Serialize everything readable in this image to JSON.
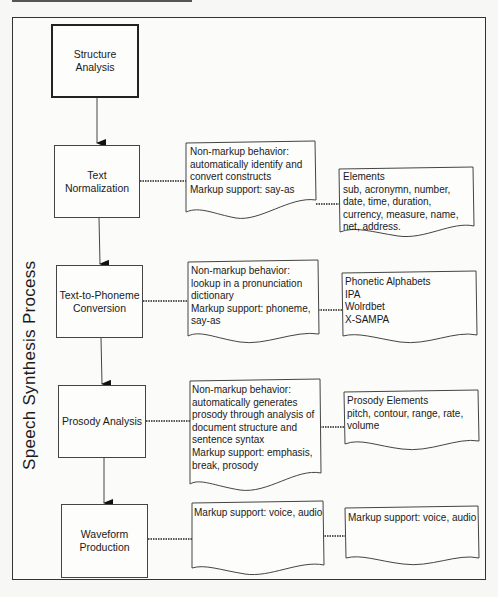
{
  "diagram": {
    "title": "Speech Synthesis Process",
    "steps": [
      {
        "label_line1": "Structure",
        "label_line2": "Analysis"
      },
      {
        "label_line1": "Text",
        "label_line2": "Normalization"
      },
      {
        "label_line1": "Text-to-Phoneme",
        "label_line2": "Conversion"
      },
      {
        "label_line1": "Prosody Analysis",
        "label_line2": ""
      },
      {
        "label_line1": "Waveform",
        "label_line2": "Production"
      }
    ],
    "behavior_notes": [
      {
        "lines": [
          "Non-markup behavior:",
          "automatically identify and",
          "convert constructs",
          "Markup support: say-as"
        ]
      },
      {
        "lines": [
          "Non-markup behavior:",
          "lookup in a pronunciation",
          "dictionary",
          "Markup support: phoneme,",
          "say-as"
        ]
      },
      {
        "lines": [
          "Non-markup behavior:",
          "automatically generates",
          "prosody through analysis of",
          "document structure and",
          "sentence syntax",
          "Markup support: emphasis,",
          "break, prosody"
        ]
      },
      {
        "lines": [
          "Markup support: voice, audio"
        ]
      }
    ],
    "element_notes": [
      {
        "lines": [
          "Elements",
          "sub, acronymn, number,",
          "date, time, duration,",
          "currency, measure, name,",
          "net, address."
        ]
      },
      {
        "lines": [
          "Phonetic Alphabets",
          "IPA",
          "Wolrdbet",
          "X-SAMPA"
        ]
      },
      {
        "lines": [
          "Prosody Elements",
          "pitch, contour, range, rate,",
          "volume"
        ]
      },
      {
        "lines": [
          "Markup support: voice, audio"
        ]
      }
    ],
    "colors": {
      "line": "#333333",
      "background": "#fbfbfa"
    }
  }
}
